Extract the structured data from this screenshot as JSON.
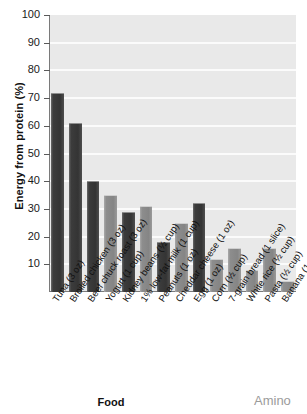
{
  "chart_data": {
    "type": "bar",
    "title": "",
    "xlabel": "Food",
    "ylabel": "Energy from protein (%)",
    "ylim": [
      0,
      100
    ],
    "yticks": [
      10,
      20,
      30,
      40,
      50,
      60,
      70,
      80,
      90,
      100
    ],
    "grid": true,
    "legend": null,
    "categories": [
      "Tuna (3 oz)",
      "Broiled chicken (3 oz)",
      "Beef chuck roast (3 oz)",
      "Yogurt (1 cup)",
      "Kidney beans (½ cup)",
      "1% low-fat milk (1 cup)",
      "Peanuts (1 oz)",
      "Cheddar cheese (1 oz)",
      "Egg (1 oz)",
      "Corn (½ cup)",
      "7-grain bread (1 slice)",
      "White rice (½ cup)",
      "Pasta (½ cup)",
      "Banana (1 medium)"
    ],
    "values": [
      72,
      61,
      40,
      35,
      29,
      31,
      18,
      25,
      32,
      12,
      16,
      8,
      16,
      4
    ],
    "bar_shades": [
      "dark",
      "dark",
      "dark",
      "light",
      "dark",
      "light",
      "dark",
      "light",
      "dark",
      "light",
      "light",
      "light",
      "light",
      "light"
    ],
    "colors": {
      "plot_background": "#e9e9e9",
      "gridline": "#fbfbfb",
      "bar_dark": "#3c3c3c",
      "bar_light": "#8d8d8d",
      "axis": "#7a7a7a",
      "text": "#111111"
    }
  },
  "annotations": {
    "side_text": "Amino"
  }
}
